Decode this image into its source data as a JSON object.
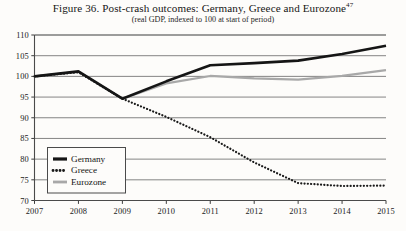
{
  "figure": {
    "title": "Figure 36. Post-crash outcomes: Germany, Greece and Eurozone",
    "title_footnote": "47",
    "subtitle": "(real GDP, indexed to 100 at start of period)"
  },
  "chart_data": {
    "type": "line",
    "title": "Figure 36. Post-crash outcomes: Germany, Greece and Eurozone",
    "subtitle": "(real GDP, indexed to 100 at start of period)",
    "xlabel": "",
    "ylabel": "",
    "x": [
      2007,
      2008,
      2009,
      2010,
      2011,
      2012,
      2013,
      2014,
      2015
    ],
    "categories": [
      "2007",
      "2008",
      "2009",
      "2010",
      "2011",
      "2012",
      "2013",
      "2014",
      "2015"
    ],
    "xlim": [
      2007,
      2015
    ],
    "ylim": [
      70,
      110
    ],
    "yticks": [
      70,
      75,
      80,
      85,
      90,
      95,
      100,
      105,
      110
    ],
    "xticks": [
      2007,
      2008,
      2009,
      2010,
      2011,
      2012,
      2013,
      2014,
      2015
    ],
    "grid": "horizontal",
    "legend_position": "lower-left",
    "series": [
      {
        "name": "Germany",
        "style": "solid",
        "color": "#151515",
        "width": 2.6,
        "values": [
          100.0,
          101.2,
          94.6,
          98.8,
          102.7,
          103.2,
          103.8,
          105.4,
          107.4
        ]
      },
      {
        "name": "Greece",
        "style": "dotted",
        "color": "#1a1a1a",
        "width": 2.2,
        "values": [
          100.0,
          101.0,
          94.6,
          90.2,
          85.3,
          79.2,
          74.2,
          73.5,
          73.6
        ]
      },
      {
        "name": "Eurozone",
        "style": "solid",
        "color": "#a8a8a8",
        "width": 2.2,
        "values": [
          100.0,
          101.1,
          94.6,
          98.3,
          100.1,
          99.5,
          99.2,
          100.1,
          101.5
        ]
      }
    ]
  },
  "legend": {
    "items": [
      {
        "label": "Germany"
      },
      {
        "label": "Greece"
      },
      {
        "label": "Eurozone"
      }
    ]
  },
  "axis": {
    "y_labels": [
      "110",
      "105",
      "100",
      "95",
      "90",
      "85",
      "80",
      "75",
      "70"
    ],
    "x_labels": [
      "2007",
      "2008",
      "2009",
      "2010",
      "2011",
      "2012",
      "2013",
      "2014",
      "2015"
    ]
  }
}
